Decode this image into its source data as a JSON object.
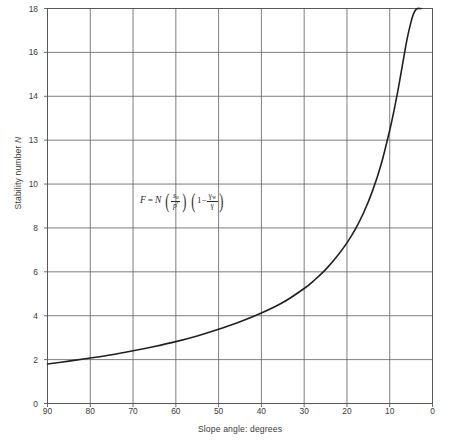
{
  "chart_data": {
    "type": "line",
    "title": "",
    "xlabel": "Slope angle: degrees",
    "ylabel": "Stability number N",
    "xlim": [
      90,
      0
    ],
    "ylim": [
      0,
      18
    ],
    "x_reversed": true,
    "grid": true,
    "legend": "none",
    "xticks": [
      "90",
      "80",
      "70",
      "60",
      "50",
      "40",
      "30",
      "20",
      "10",
      "0"
    ],
    "xtick_values": [
      90,
      80,
      70,
      60,
      50,
      40,
      30,
      20,
      10,
      0
    ],
    "yticks": [
      "0",
      "2",
      "4",
      "6",
      "8",
      "10",
      "13",
      "14",
      "16",
      "18"
    ],
    "ytick_values": [
      0,
      2,
      4,
      6,
      8,
      10,
      12,
      14,
      16,
      18
    ],
    "annotations": [
      {
        "name": "stability-formula",
        "text": "F = N (su/p') (1 - γw/γ)",
        "x": 53,
        "y": 9.3
      }
    ],
    "series": [
      {
        "name": "Stability number curve",
        "color": "#231f20",
        "linewidth": 1.6,
        "x": [
          90,
          85,
          80,
          75,
          70,
          65,
          60,
          55,
          50,
          45,
          40,
          35,
          30,
          27.5,
          25,
          22.5,
          20,
          18,
          16,
          14,
          12,
          10,
          9,
          8,
          7,
          6,
          5,
          4.5,
          4,
          3.5,
          3,
          2.7
        ],
        "y": [
          1.8,
          1.93,
          2.07,
          2.22,
          2.4,
          2.6,
          2.82,
          3.08,
          3.38,
          3.72,
          4.12,
          4.6,
          5.24,
          5.64,
          6.1,
          6.66,
          7.32,
          7.96,
          8.74,
          9.7,
          10.9,
          12.45,
          13.35,
          14.35,
          15.45,
          16.55,
          17.4,
          17.72,
          17.92,
          18.02,
          18.06,
          18.08
        ]
      }
    ]
  },
  "formula": {
    "F": "F",
    "equals": "=",
    "N": "N",
    "numerator_s": "s",
    "numerator_sub": "u",
    "denominator_p": "p",
    "denominator_prime": "′",
    "one": "1",
    "minus": "−",
    "gamma_w_num": "γ",
    "gamma_w_sub": "w",
    "gamma_den": "γ",
    "paren_open": "(",
    "paren_close": ")"
  },
  "axes": {
    "x_title": "Slope angle: degrees",
    "y_title_text": "Stability number ",
    "y_title_symbol": "N"
  }
}
